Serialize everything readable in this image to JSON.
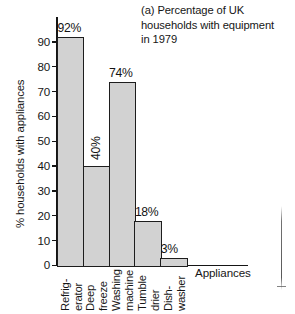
{
  "chart_data": {
    "type": "bar",
    "title": "(a) Percentage of UK households with equipment in 1979",
    "title_lines": [
      "(a) Percentage of UK",
      "households with equipment",
      "in 1979"
    ],
    "categories": [
      "Refrigerator",
      "Deep freeze",
      "Washing machine",
      "Tumble drier",
      "Dishwasher"
    ],
    "category_label_lines": [
      [
        "Refrig-",
        "erator"
      ],
      [
        "Deep",
        "freeze"
      ],
      [
        "Washing",
        "machine"
      ],
      [
        "Tumble",
        "drier"
      ],
      [
        "Dish-",
        "washer"
      ]
    ],
    "values": [
      92,
      40,
      74,
      18,
      3
    ],
    "value_labels": [
      "92%",
      "40%",
      "74%",
      "18%",
      "3%"
    ],
    "xlabel": "Appliances",
    "ylabel": "% households with appliances",
    "ylim": [
      0,
      100
    ],
    "yticks": [
      0,
      10,
      20,
      30,
      40,
      50,
      60,
      70,
      80,
      90
    ],
    "ytick_labels": [
      "0",
      "10",
      "20",
      "30",
      "40",
      "50",
      "60",
      "70",
      "80",
      "90"
    ],
    "grid": false,
    "legend": false,
    "bar_fill_color": "#d2d2d2",
    "bar_border_color": "#1d1d1d",
    "axis_color": "#151515",
    "text_color": "#161616"
  }
}
